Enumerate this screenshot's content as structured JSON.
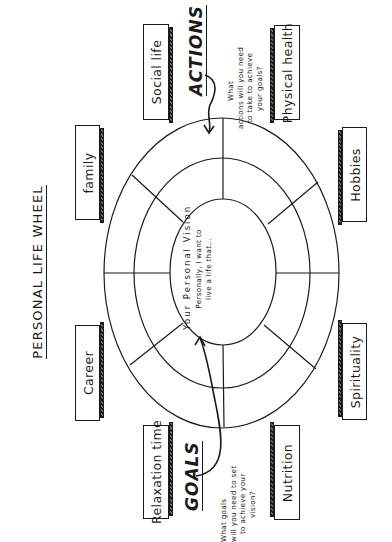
{
  "title": "PERSONAL LIFE WHEEL",
  "center": {
    "heading": "Your Personal Vision",
    "prompt_line1": "Personally, I want to",
    "prompt_line2": "live a life that..."
  },
  "actions": {
    "label": "ACTIONS",
    "question_line1": "What",
    "question_line2": "actions will you need",
    "question_line3": "to take to achieve",
    "question_line4": "your goals?"
  },
  "goals": {
    "label": "GOALS",
    "question_line1": "What goals",
    "question_line2": "will you need to set",
    "question_line3": "to achieve your",
    "question_line4": "vision?"
  },
  "life_areas": [
    {
      "label": "family"
    },
    {
      "label": "Social life"
    },
    {
      "label": "Physical health"
    },
    {
      "label": "Hobbies"
    },
    {
      "label": "Career"
    },
    {
      "label": "Relaxation time"
    },
    {
      "label": "Nutrition"
    },
    {
      "label": "Spirituality"
    }
  ],
  "wheel": {
    "rings": 3,
    "segments": 8,
    "stroke_color": "#1a1a1a"
  }
}
